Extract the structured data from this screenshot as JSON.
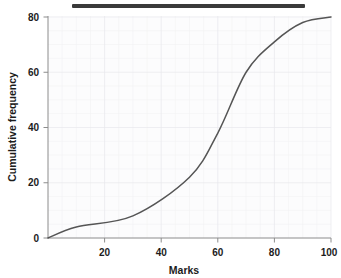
{
  "figure": {
    "title_bar_label": "redacted-title-bar"
  },
  "chart_data": {
    "type": "line",
    "title": "",
    "xlabel": "Marks",
    "ylabel": "Cumulative frequency",
    "xlim": [
      0,
      100
    ],
    "ylim": [
      0,
      80
    ],
    "xticks": [
      0,
      20,
      40,
      60,
      80,
      100
    ],
    "xtick_labels": [
      "",
      "20",
      "40",
      "60",
      "80",
      "100"
    ],
    "yticks": [
      0,
      20,
      40,
      60,
      80
    ],
    "ytick_labels": [
      "0",
      "20",
      "40",
      "60",
      "80"
    ],
    "grid": true,
    "legend": false,
    "series": [
      {
        "name": "Cumulative frequency",
        "color": "#555555",
        "x": [
          0,
          10,
          30,
          50,
          60,
          70,
          80,
          90,
          100
        ],
        "values": [
          0,
          4,
          8,
          22,
          38,
          60,
          71,
          78,
          80
        ]
      }
    ]
  }
}
